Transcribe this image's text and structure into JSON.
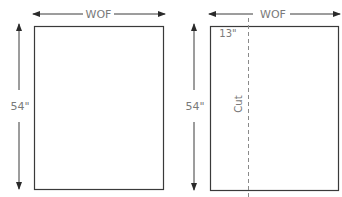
{
  "diagrams": [
    {
      "name": "full-fabric",
      "width_label": "WOF",
      "height_label": "54\""
    },
    {
      "name": "cut-fabric",
      "width_label": "WOF",
      "height_label": "54\"",
      "offset_label": "13\"",
      "cut_label": "Cut"
    }
  ],
  "colors": {
    "line": "#3a3a3a",
    "text": "#7a7a7a",
    "dash": "#8a8a8a"
  }
}
